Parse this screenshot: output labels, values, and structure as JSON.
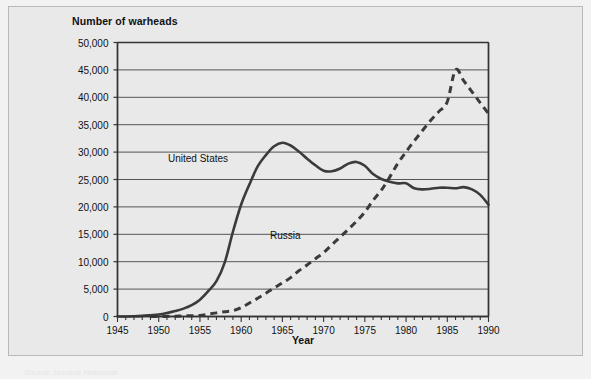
{
  "figure": {
    "background_color": "#e9e9e9",
    "frame_color": "#b9b9b9",
    "footer_note": "Source: Nuclear Notebook"
  },
  "chart_data": {
    "type": "line",
    "title": "Number of warheads",
    "subtitle": "",
    "xlabel": "Year",
    "ylabel": "Number of warheads",
    "xlim": [
      1945,
      1990
    ],
    "ylim": [
      0,
      50000
    ],
    "xticks": [
      1945,
      1950,
      1955,
      1960,
      1965,
      1970,
      1975,
      1980,
      1985,
      1990
    ],
    "xtick_labels": [
      "1945",
      "1950",
      "1955",
      "1960",
      "1965",
      "1970",
      "1975",
      "1980",
      "1985",
      "1990"
    ],
    "x_minor_tick_interval": 1,
    "yticks": [
      0,
      5000,
      10000,
      15000,
      20000,
      25000,
      30000,
      35000,
      40000,
      45000,
      50000
    ],
    "ytick_labels": [
      "0",
      "5,000",
      "10,000",
      "15,000",
      "20,000",
      "25,000",
      "30,000",
      "35,000",
      "40,000",
      "45,000",
      "50,000"
    ],
    "grid": "horizontal",
    "legend": "inline-annotations",
    "series": [
      {
        "name": "United States",
        "style": "solid",
        "color": "#3b3b3b",
        "label_position": "inline",
        "x": [
          1945,
          1946,
          1947,
          1948,
          1949,
          1950,
          1951,
          1952,
          1953,
          1954,
          1955,
          1956,
          1957,
          1958,
          1959,
          1960,
          1961,
          1962,
          1963,
          1964,
          1965,
          1966,
          1967,
          1968,
          1969,
          1970,
          1971,
          1972,
          1973,
          1974,
          1975,
          1976,
          1977,
          1978,
          1979,
          1980,
          1981,
          1982,
          1983,
          1984,
          1985,
          1986,
          1987,
          1988,
          1989,
          1990
        ],
        "values": [
          6,
          11,
          32,
          110,
          235,
          369,
          640,
          1005,
          1436,
          2063,
          3057,
          4618,
          6444,
          9822,
          15468,
          20434,
          24111,
          27387,
          29459,
          31056,
          31700,
          31200,
          30100,
          28800,
          27600,
          26600,
          26500,
          27000,
          27900,
          28200,
          27500,
          26000,
          25100,
          24600,
          24300,
          24300,
          23400,
          23200,
          23300,
          23500,
          23500,
          23400,
          23600,
          23200,
          22200,
          20400
        ]
      },
      {
        "name": "Russia",
        "style": "dashed",
        "color": "#3b3b3b",
        "label_position": "inline",
        "x": [
          1949,
          1950,
          1951,
          1952,
          1953,
          1954,
          1955,
          1956,
          1957,
          1958,
          1959,
          1960,
          1961,
          1962,
          1963,
          1964,
          1965,
          1966,
          1967,
          1968,
          1969,
          1970,
          1971,
          1972,
          1973,
          1974,
          1975,
          1976,
          1977,
          1978,
          1979,
          1980,
          1981,
          1982,
          1983,
          1984,
          1985,
          1986,
          1987,
          1988,
          1989,
          1990
        ],
        "values": [
          1,
          5,
          25,
          50,
          120,
          150,
          200,
          426,
          660,
          869,
          1060,
          1605,
          2471,
          3322,
          4238,
          5221,
          6129,
          7089,
          8339,
          9399,
          10538,
          11643,
          13092,
          14478,
          15915,
          17385,
          19055,
          21205,
          23044,
          25393,
          27935,
          30062,
          32049,
          33952,
          35804,
          37431,
          39197,
          45000,
          43000,
          41000,
          39000,
          37000
        ]
      }
    ],
    "annotations": [
      {
        "text": "United States",
        "x": 1957.5,
        "y": 26500
      },
      {
        "text": "Russia",
        "x": 1966.5,
        "y": 12500
      }
    ]
  }
}
